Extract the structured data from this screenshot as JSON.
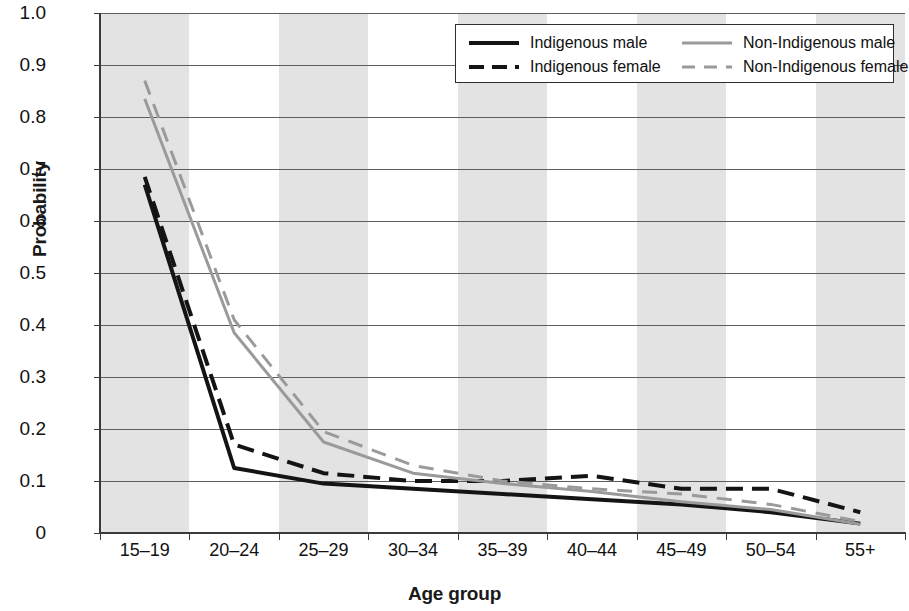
{
  "chart_data": {
    "type": "line",
    "title": "",
    "xlabel": "Age group",
    "ylabel": "Probability",
    "categories": [
      "15–19",
      "20–24",
      "25–29",
      "30–34",
      "35–39",
      "40–44",
      "45–49",
      "50–54",
      "55+"
    ],
    "ylim": [
      0,
      1.0
    ],
    "yticks": [
      "0",
      "0.1",
      "0.2",
      "0.3",
      "0.4",
      "0.5",
      "0.6",
      "0.7",
      "0.8",
      "0.9",
      "1.0"
    ],
    "ytick_values": [
      0,
      0.1,
      0.2,
      0.3,
      0.4,
      0.5,
      0.6,
      0.7,
      0.8,
      0.9,
      1.0
    ],
    "grid": "horizontal",
    "banding": "alternating vertical gray bands on odd categories",
    "legend_position": "top-right inside plot",
    "series": [
      {
        "name": "Indigenous male",
        "color": "#141414",
        "style": "solid",
        "values": [
          0.67,
          0.125,
          0.095,
          0.085,
          0.075,
          0.065,
          0.055,
          0.04,
          0.018
        ]
      },
      {
        "name": "Indigenous female",
        "color": "#141414",
        "style": "dashed",
        "values": [
          0.685,
          0.17,
          0.115,
          0.1,
          0.1,
          0.11,
          0.085,
          0.085,
          0.04
        ]
      },
      {
        "name": "Non-Indigenous male",
        "color": "#9a9a9a",
        "style": "solid",
        "values": [
          0.835,
          0.385,
          0.175,
          0.115,
          0.095,
          0.08,
          0.06,
          0.045,
          0.017
        ]
      },
      {
        "name": "Non-Indigenous female",
        "color": "#9a9a9a",
        "style": "dashed",
        "values": [
          0.87,
          0.41,
          0.195,
          0.13,
          0.1,
          0.085,
          0.075,
          0.055,
          0.022
        ]
      }
    ]
  },
  "legend": {
    "items": [
      {
        "label": "Indigenous male"
      },
      {
        "label": "Indigenous female"
      },
      {
        "label": "Non-Indigenous male"
      },
      {
        "label": "Non-Indigenous female"
      }
    ]
  }
}
